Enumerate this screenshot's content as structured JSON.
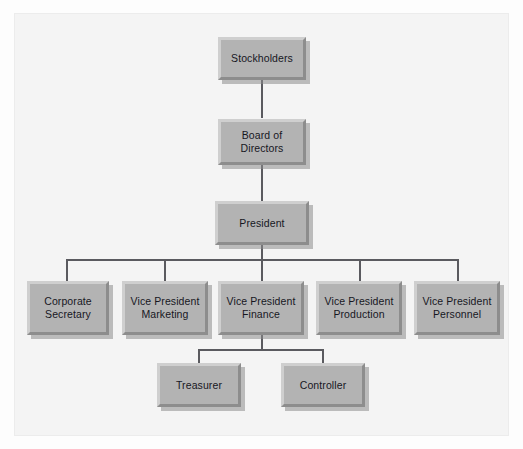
{
  "chart": {
    "type": "org-chart",
    "background_color": "#fdfdfd",
    "panel_color": "#f4f4f4",
    "node_fill_color": "#b3b3b3",
    "node_highlight_color": "#cfcfcf",
    "node_shade_color": "#8d8d8d",
    "connector_color": "#5a5a5f",
    "text_color": "#17171f",
    "levels": [
      {
        "level": 1,
        "nodes": [
          {
            "id": "stockholders",
            "label": "Stockholders"
          }
        ]
      },
      {
        "level": 2,
        "nodes": [
          {
            "id": "board-of-directors",
            "label": "Board of\nDirectors"
          }
        ]
      },
      {
        "level": 3,
        "nodes": [
          {
            "id": "president",
            "label": "President"
          }
        ]
      },
      {
        "level": 4,
        "nodes": [
          {
            "id": "corporate-secretary",
            "label": "Corporate\nSecretary"
          },
          {
            "id": "vice-president-marketing",
            "label": "Vice President\nMarketing"
          },
          {
            "id": "vice-president-finance",
            "label": "Vice President\nFinance"
          },
          {
            "id": "vice-president-production",
            "label": "Vice President\nProduction"
          },
          {
            "id": "vice-president-personnel",
            "label": "Vice President\nPersonnel"
          }
        ]
      },
      {
        "level": 5,
        "nodes": [
          {
            "id": "treasurer",
            "label": "Treasurer"
          },
          {
            "id": "controller",
            "label": "Controller"
          }
        ]
      }
    ],
    "edges": [
      {
        "from": "stockholders",
        "to": "board-of-directors"
      },
      {
        "from": "board-of-directors",
        "to": "president"
      },
      {
        "from": "president",
        "to": "corporate-secretary"
      },
      {
        "from": "president",
        "to": "vice-president-marketing"
      },
      {
        "from": "president",
        "to": "vice-president-finance"
      },
      {
        "from": "president",
        "to": "vice-president-production"
      },
      {
        "from": "president",
        "to": "vice-president-personnel"
      },
      {
        "from": "vice-president-finance",
        "to": "treasurer"
      },
      {
        "from": "vice-president-finance",
        "to": "controller"
      }
    ]
  }
}
